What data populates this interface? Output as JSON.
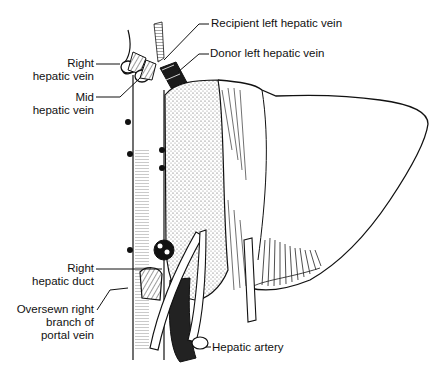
{
  "diagram": {
    "colors": {
      "ink": "#111111",
      "background": "#ffffff",
      "stipple": "#555555"
    },
    "labels": [
      {
        "id": "recipient-left-hepatic-vein",
        "lines": [
          "Recipient left hepatic vein"
        ]
      },
      {
        "id": "donor-left-hepatic-vein",
        "lines": [
          "Donor left hepatic vein"
        ]
      },
      {
        "id": "right-hepatic-vein",
        "lines": [
          "Right",
          "hepatic vein"
        ]
      },
      {
        "id": "mid-hepatic-vein",
        "lines": [
          "Mid",
          "hepatic vein"
        ]
      },
      {
        "id": "right-hepatic-duct",
        "lines": [
          "Right",
          "hepatic duct"
        ]
      },
      {
        "id": "oversewn-right-portal",
        "lines": [
          "Oversewn right",
          "branch of",
          "portal vein"
        ]
      },
      {
        "id": "hepatic-artery",
        "lines": [
          "Hepatic artery"
        ]
      }
    ]
  }
}
